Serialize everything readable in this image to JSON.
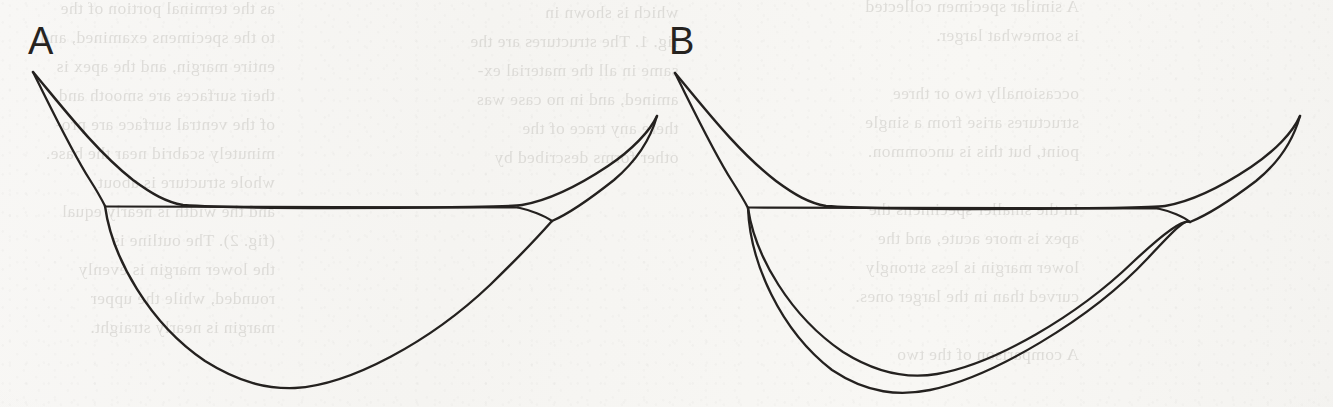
{
  "plate": {
    "kind": "scanned-line-drawing-figure-plate",
    "width": 1333,
    "height": 407,
    "paper_color": "#f7f6f3",
    "ink_color": "#24211f",
    "ghost_text_color": "#b9b7b2"
  },
  "panels": [
    {
      "id": "A",
      "label": "A",
      "description": "Outline drawing: slender curved structure with a pointed upper-left apex, a straight horizontal chord, a single deep rounded lower margin, and an upswept pointed beak at the right.",
      "lower_margin_lines": 1
    },
    {
      "id": "B",
      "label": "B",
      "description": "Outline drawing: same slender curved structure, but the lower margin is drawn as two closely spaced nested curves.",
      "lower_margin_lines": 2
    }
  ],
  "ghost_text": {
    "note": "Faint mirrored bleed-through of printed text from the reverse side of the page.",
    "columns": [
      {
        "lines": [
          "as the terminal portion of the",
          "to the specimens examined, and",
          "entire margin, and the apex is",
          "their surfaces are smooth and",
          "of the ventral surface are pro-",
          "minutely scabrid near the base.",
          "whole structure is about",
          "and the width is nearly equal",
          "(fig. 2). The outline is",
          "the lower margin is evenly",
          "rounded, while the upper",
          "margin is nearly straight."
        ]
      },
      {
        "lines": [
          "which is shown in",
          "fig. 1. The structures are the",
          "same in all the material ex-",
          "amined, and in no case was",
          "there any trace of the",
          "other forms described by"
        ]
      },
      {
        "lines": [
          "A similar specimen collected",
          "is somewhat larger.",
          "",
          "occasionally two or three",
          "structures arise from a single",
          "point, but this is uncommon.",
          "",
          "In the smaller specimens the",
          "apex is more acute, and the",
          "lower margin is less strongly",
          "curved than in the larger ones.",
          "",
          "A comparison of the two"
        ]
      }
    ]
  }
}
